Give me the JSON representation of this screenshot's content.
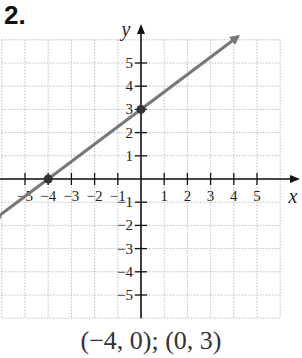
{
  "problem_number": "2.",
  "caption": "(−4, 0); (0, 3)",
  "chart_data": {
    "type": "line",
    "title": "",
    "xlabel": "x",
    "ylabel": "y",
    "xlim": [
      -6,
      6
    ],
    "ylim": [
      -6,
      6
    ],
    "grid": true,
    "x_ticks": [
      -5,
      -4,
      -3,
      -2,
      -1,
      1,
      2,
      3,
      4,
      5
    ],
    "x_tick_labels": [
      "−5",
      "−4",
      "−3",
      "−2",
      "−1",
      "1",
      "2",
      "3",
      "4",
      "5"
    ],
    "y_ticks": [
      -5,
      -4,
      -3,
      -2,
      -1,
      1,
      2,
      3,
      4,
      5
    ],
    "y_tick_labels": [
      "−5",
      "−4",
      "−3",
      "−2",
      "−1",
      "1",
      "2",
      "3",
      "4",
      "5"
    ],
    "series": [
      {
        "name": "line",
        "equation": "y = 0.75x + 3",
        "x": [
          -6,
          4.2
        ],
        "y": [
          -1.5,
          6.15
        ],
        "arrows": "both",
        "color": "#777777"
      }
    ],
    "points": [
      {
        "x": -4,
        "y": 0,
        "label": "(−4, 0)"
      },
      {
        "x": 0,
        "y": 3,
        "label": "(0, 3)"
      }
    ]
  }
}
